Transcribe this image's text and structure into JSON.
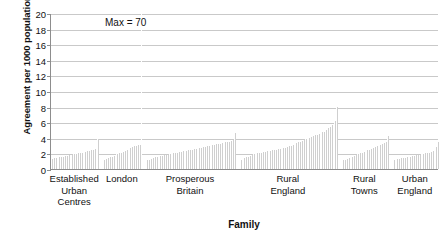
{
  "chart_data": {
    "type": "bar",
    "title": "",
    "xlabel": "Family",
    "ylabel": "Agreement per 1000 population",
    "ylim": [
      0,
      20
    ],
    "ytick_step": 2,
    "yticks": [
      20,
      18,
      16,
      14,
      12,
      10,
      8,
      6,
      4,
      2,
      0
    ],
    "grid": true,
    "legend": "none",
    "bar_color": "#cfcfcf",
    "annotations": [
      {
        "text": "Max = 70",
        "near_group": "London",
        "note": "off-scale spike exceeds axis maximum"
      }
    ],
    "categories": [
      "Established Urban Centres",
      "London",
      "Prosperous Britain",
      "Rural England",
      "Rural Towns",
      "Urban England"
    ],
    "groups": [
      {
        "name": "Established Urban Centres",
        "label_lines": [
          "Established",
          "Urban",
          "Centres"
        ],
        "values": [
          1.3,
          1.35,
          1.4,
          1.45,
          1.5,
          1.55,
          1.6,
          1.65,
          1.7,
          1.75,
          1.8,
          1.85,
          1.9,
          1.95,
          2.0,
          2.05,
          2.1,
          2.15,
          2.2,
          2.25,
          2.3,
          2.4,
          2.5,
          2.6,
          2.7,
          3.9
        ]
      },
      {
        "name": "London",
        "label_lines": [
          "London"
        ],
        "values": [
          1.2,
          1.3,
          1.4,
          1.5,
          1.6,
          1.7,
          1.8,
          1.9,
          2.0,
          2.1,
          2.2,
          2.3,
          2.45,
          2.6,
          2.7,
          2.8,
          2.9,
          3.0,
          3.05,
          3.1,
          70.0
        ]
      },
      {
        "name": "Prosperous Britain",
        "label_lines": [
          "Prosperous",
          "Britain"
        ],
        "values": [
          1.1,
          1.2,
          1.3,
          1.4,
          1.5,
          1.55,
          1.6,
          1.65,
          1.7,
          1.75,
          1.8,
          1.85,
          1.9,
          1.95,
          2.0,
          2.05,
          2.1,
          2.15,
          2.2,
          2.25,
          2.3,
          2.35,
          2.4,
          2.45,
          2.5,
          2.55,
          2.6,
          2.65,
          2.7,
          2.75,
          2.8,
          2.85,
          2.9,
          2.95,
          3.0,
          3.05,
          3.1,
          3.15,
          3.2,
          3.25,
          3.3,
          3.35,
          3.4,
          3.45,
          3.5,
          3.6,
          3.7,
          4.6
        ]
      },
      {
        "name": "Rural England",
        "label_lines": [
          "Rural",
          "England"
        ],
        "values": [
          1.2,
          1.3,
          1.4,
          1.5,
          1.6,
          1.7,
          1.8,
          1.9,
          1.95,
          2.0,
          2.05,
          2.1,
          2.15,
          2.2,
          2.25,
          2.3,
          2.35,
          2.4,
          2.45,
          2.5,
          2.55,
          2.6,
          2.65,
          2.7,
          2.75,
          2.8,
          2.9,
          3.0,
          3.1,
          3.2,
          3.3,
          3.4,
          3.5,
          3.6,
          3.7,
          3.8,
          3.9,
          4.0,
          4.1,
          4.2,
          4.3,
          4.4,
          4.5,
          4.6,
          4.7,
          4.8,
          5.0,
          5.2,
          5.4,
          5.6,
          5.8,
          6.2,
          7.9
        ]
      },
      {
        "name": "Rural Towns",
        "label_lines": [
          "Rural",
          "Towns"
        ],
        "values": [
          1.1,
          1.2,
          1.3,
          1.4,
          1.5,
          1.6,
          1.7,
          1.8,
          1.9,
          2.0,
          2.1,
          2.2,
          2.3,
          2.4,
          2.5,
          2.6,
          2.7,
          2.8,
          2.9,
          3.0,
          3.1,
          3.2,
          3.3,
          3.4,
          4.2
        ]
      },
      {
        "name": "Urban England",
        "label_lines": [
          "Urban",
          "England"
        ],
        "values": [
          1.1,
          1.2,
          1.25,
          1.3,
          1.35,
          1.4,
          1.45,
          1.5,
          1.55,
          1.6,
          1.65,
          1.7,
          1.75,
          1.8,
          1.85,
          1.9,
          1.95,
          2.0,
          2.05,
          2.1,
          2.2,
          2.3,
          2.5,
          2.8,
          3.5
        ]
      }
    ]
  }
}
